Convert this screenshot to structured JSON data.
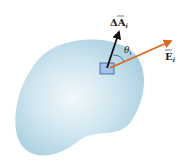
{
  "diagram": {
    "surface": {
      "fill": "#bcdcea",
      "highlight": "#eef6fa"
    },
    "area_element": {
      "fill": "#9fc4ec",
      "stroke": "#3a5a8a"
    },
    "normal_vector": {
      "label_delta": "Δ",
      "label_letter": "A",
      "label_sub": "i",
      "color": "#111111"
    },
    "field_vector": {
      "label_letter": "E",
      "label_sub": "i",
      "color": "#e0661f"
    },
    "angle": {
      "label_letter": "θ",
      "label_sub": "i"
    }
  }
}
